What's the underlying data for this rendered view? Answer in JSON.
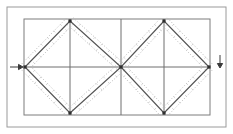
{
  "figure": {
    "background_color": "#ffffff",
    "width": 233,
    "height": 134
  },
  "colors": {
    "outer_frame": "#9a9a9a",
    "inner_rect": "#7d7d7d",
    "grid_line": "#6f6f6f",
    "diagonal": "#555555",
    "tolerance_band": "#b4b4b4",
    "node": "#2f2f2f",
    "arrow": "#3a3a3a"
  },
  "outer_frame": {
    "label": "outer-frame",
    "x": 7,
    "y": 7,
    "width": 219,
    "height": 120
  },
  "inner_rect": {
    "label": "inner-rectangle",
    "x": 24,
    "y": 19,
    "width": 186,
    "height": 96
  },
  "grid": {
    "horizontal_midline": {
      "label": "horizontal-centerline",
      "y": 67,
      "x1": 24,
      "x2": 210
    },
    "vertical_lines": [
      {
        "label": "vertical-left-bay-center",
        "x": 70,
        "y1": 19,
        "y2": 115
      },
      {
        "label": "vertical-bay-divider",
        "x": 121,
        "y1": 19,
        "y2": 115
      },
      {
        "label": "vertical-right-bay-center",
        "x": 164,
        "y1": 19,
        "y2": 115
      }
    ]
  },
  "nodes": [
    {
      "label": "node-left-mid",
      "name": "A",
      "x": 25,
      "y": 67
    },
    {
      "label": "node-left-top",
      "name": "B",
      "x": 70,
      "y": 21
    },
    {
      "label": "node-center-mid",
      "name": "C",
      "x": 121,
      "y": 67
    },
    {
      "label": "node-left-bottom",
      "name": "D",
      "x": 70,
      "y": 113
    },
    {
      "label": "node-right-top",
      "name": "E",
      "x": 164,
      "y": 21
    },
    {
      "label": "node-right-mid",
      "name": "F",
      "x": 209,
      "y": 67
    },
    {
      "label": "node-right-bottom",
      "name": "G",
      "x": 164,
      "y": 113
    }
  ],
  "diagonals": [
    {
      "label": "diag-A-B",
      "x1": 25,
      "y1": 67,
      "x2": 70,
      "y2": 21
    },
    {
      "label": "diag-B-C",
      "x1": 70,
      "y1": 21,
      "x2": 121,
      "y2": 67
    },
    {
      "label": "diag-C-D",
      "x1": 121,
      "y1": 67,
      "x2": 70,
      "y2": 113
    },
    {
      "label": "diag-D-A",
      "x1": 70,
      "y1": 113,
      "x2": 25,
      "y2": 67
    },
    {
      "label": "diag-C-E",
      "x1": 121,
      "y1": 67,
      "x2": 164,
      "y2": 21
    },
    {
      "label": "diag-E-F",
      "x1": 164,
      "y1": 21,
      "x2": 209,
      "y2": 67
    },
    {
      "label": "diag-F-G",
      "x1": 209,
      "y1": 67,
      "x2": 164,
      "y2": 113
    },
    {
      "label": "diag-G-C",
      "x1": 164,
      "y1": 113,
      "x2": 121,
      "y2": 67
    }
  ],
  "tolerance_band": {
    "label": "dotted-offset-band",
    "offset_px": 4.5,
    "style": "dotted",
    "description": "Dotted lines drawn parallel on both sides of each diagonal member"
  },
  "arrows": [
    {
      "label": "load-arrow-left",
      "name": "arrow-right-pointing",
      "direction": "right",
      "x": 10,
      "y": 67,
      "length": 13
    },
    {
      "label": "load-arrow-right",
      "name": "arrow-down-pointing",
      "direction": "down",
      "x": 220,
      "y": 55,
      "length": 13
    }
  ]
}
